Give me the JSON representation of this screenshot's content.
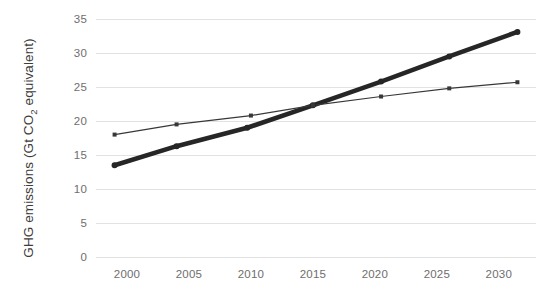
{
  "chart_data": {
    "type": "line",
    "title": "",
    "xlabel": "",
    "ylabel": "GHG emissions (Gt CO2 equivalent)",
    "ylabel_prefix": "GHG emissions (Gt CO",
    "ylabel_subscript": "2",
    "ylabel_suffix": " equivalent)",
    "xlim": [
      1997.5,
      2033.0
    ],
    "ylim": [
      0,
      35
    ],
    "grid": "horizontal",
    "legend": "none",
    "xticks": [
      2000,
      2005,
      2010,
      2015,
      2020,
      2025,
      2030
    ],
    "xtick_labels": [
      "2000",
      "2005",
      "2010",
      "2015",
      "2020",
      "2025",
      "2030"
    ],
    "yticks": [
      0,
      5,
      10,
      15,
      20,
      25,
      30,
      35
    ],
    "ytick_labels": [
      "0",
      "5",
      "10",
      "15",
      "20",
      "25",
      "30",
      "35"
    ],
    "series": [
      {
        "name": "thick-series",
        "style": "thick-line-with-markers",
        "color": "#262626",
        "x": [
          1999.0,
          2004.0,
          2009.7,
          2015.0,
          2020.5,
          2026.0,
          2031.5
        ],
        "values": [
          13.5,
          16.3,
          19.0,
          22.3,
          25.8,
          29.5,
          33.1
        ]
      },
      {
        "name": "thin-series",
        "style": "thin-line-with-markers",
        "color": "#383838",
        "x": [
          1999.0,
          2004.0,
          2010.0,
          2015.0,
          2020.5,
          2026.0,
          2031.5
        ],
        "values": [
          18.0,
          19.5,
          20.8,
          22.3,
          23.6,
          24.8,
          25.7
        ]
      }
    ]
  },
  "colors": {
    "gridline": "#e2e2e2",
    "tick_text": "#6e6e6e",
    "axis_label_text": "#3c3c3c",
    "background": "#ffffff"
  }
}
